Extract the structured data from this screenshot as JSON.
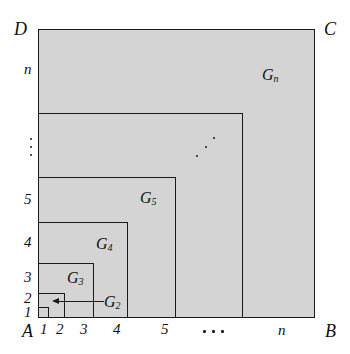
{
  "figure": {
    "type": "nested-squares-diagram",
    "background_color": "#ffffff",
    "fill_color": "#d4d4d4",
    "stroke_color": "#1a1a1a"
  },
  "corners": {
    "top_left": "D",
    "top_right": "C",
    "bottom_left": "A",
    "bottom_right": "B"
  },
  "x_axis": {
    "ticks": [
      "1",
      "2",
      "3",
      "4",
      "5"
    ],
    "ellipsis": "···",
    "last": "n"
  },
  "y_axis": {
    "ticks": [
      "1",
      "2",
      "3",
      "4",
      "5"
    ],
    "ellipsis": "⋮",
    "last": "n"
  },
  "regions": [
    {
      "label": "G",
      "sub": "2"
    },
    {
      "label": "G",
      "sub": "3"
    },
    {
      "label": "G",
      "sub": "4"
    },
    {
      "label": "G",
      "sub": "5"
    },
    {
      "label": "G",
      "sub": "n"
    }
  ],
  "gnomons": {
    "g2": {
      "label": "G",
      "sub": "2"
    },
    "g3": {
      "label": "G",
      "sub": "3"
    },
    "g4": {
      "label": "G",
      "sub": "4"
    },
    "g5": {
      "label": "G",
      "sub": "5"
    },
    "gn": {
      "label": "G",
      "sub": "n"
    }
  }
}
